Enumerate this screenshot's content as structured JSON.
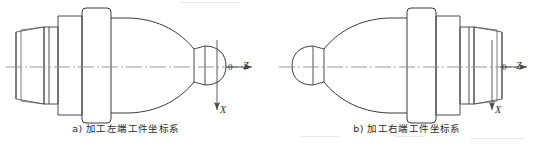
{
  "figure": {
    "type": "engineering-drawing",
    "background_color": "#ffffff",
    "line_color": "#3a3a3a",
    "centerline_color": "#8d8d8d",
    "subfigures": [
      {
        "id": "a",
        "caption": "a) 加工左端工件坐标系",
        "description": "Stepped turned workpiece, thread/boss at left, ogive taper to rounded nose at right; workpiece coordinate system origin at right end face.",
        "origin_label": "0",
        "z_axis_label": "Z",
        "z_axis_direction": "right",
        "x_axis_label": "X",
        "x_axis_direction": "down"
      },
      {
        "id": "b",
        "caption": "b) 加工右端工件坐标系",
        "description": "Mirror of subfigure a: rounded nose at left, ogive taper, stepped boss and thread at right; workpiece coordinate system origin at right end face.",
        "origin_label": "0",
        "z_axis_label": "Z",
        "z_axis_direction": "right",
        "x_axis_label": "X",
        "x_axis_direction": "down"
      }
    ]
  },
  "colors": {
    "outline": "#3a3a3a",
    "outline_light": "#5a5a5a",
    "centerline": "#8d8d8d",
    "text": "#2b2b2b",
    "page": "#ffffff"
  }
}
